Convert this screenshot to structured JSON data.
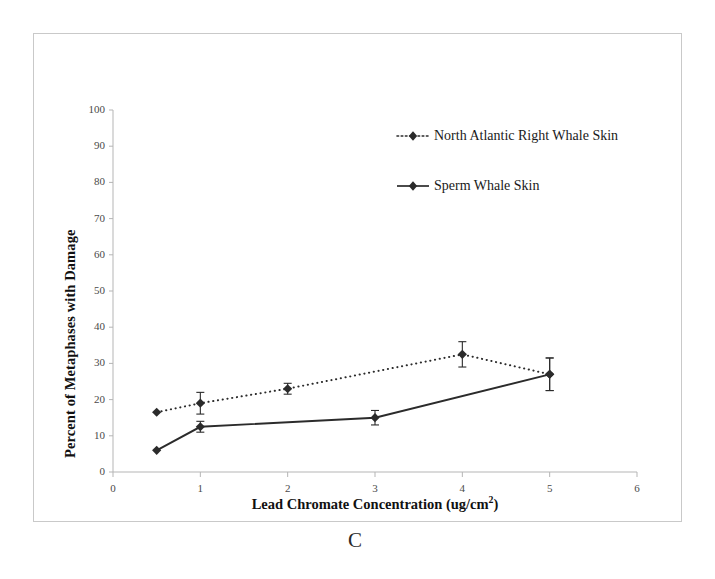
{
  "figure": {
    "panel_letter": "C",
    "frame_color": "#c9c9c9",
    "background": "#ffffff"
  },
  "axes": {
    "x": {
      "label_main": "Lead Chromate Concentration (ug/cm",
      "label_sup": "2",
      "label_tail": ")",
      "label_full": "Lead Chromate Concentration (ug/cm2)",
      "ticks": [
        0,
        1,
        2,
        3,
        4,
        5,
        6
      ],
      "min": 0,
      "max": 6
    },
    "y": {
      "label": "Percent of Metaphases with Damage",
      "ticks": [
        0,
        10,
        20,
        30,
        40,
        50,
        60,
        70,
        80,
        90,
        100
      ],
      "min": 0,
      "max": 100
    }
  },
  "legend": {
    "position": "upper-right-inside",
    "items": [
      {
        "label": "North Atlantic Right Whale Skin",
        "style": "dotted",
        "marker": "diamond",
        "color": "#2b2b2b"
      },
      {
        "label": "Sperm Whale Skin",
        "style": "solid",
        "marker": "diamond",
        "color": "#2b2b2b"
      }
    ]
  },
  "chart_data": {
    "type": "line",
    "title": "",
    "xlabel": "Lead Chromate Concentration (ug/cm2)",
    "ylabel": "Percent of Metaphases with Damage",
    "xlim": [
      0,
      6
    ],
    "ylim": [
      0,
      100
    ],
    "xticks": [
      0,
      1,
      2,
      3,
      4,
      5,
      6
    ],
    "yticks": [
      0,
      10,
      20,
      30,
      40,
      50,
      60,
      70,
      80,
      90,
      100
    ],
    "grid": false,
    "legend_position": "upper right",
    "series": [
      {
        "name": "North Atlantic Right Whale Skin",
        "linestyle": "dotted",
        "marker": "diamond",
        "color": "#2b2b2b",
        "points": [
          {
            "x": 0.5,
            "y": 16.5,
            "err": 0
          },
          {
            "x": 1,
            "y": 19,
            "err": 3
          },
          {
            "x": 2,
            "y": 23,
            "err": 1.5
          },
          {
            "x": 4,
            "y": 32.5,
            "err": 3.5
          },
          {
            "x": 5,
            "y": 27,
            "err": 4.5
          }
        ]
      },
      {
        "name": "Sperm Whale Skin",
        "linestyle": "solid",
        "marker": "diamond",
        "color": "#2b2b2b",
        "points": [
          {
            "x": 0.5,
            "y": 6,
            "err": 0
          },
          {
            "x": 1,
            "y": 12.5,
            "err": 1.5
          },
          {
            "x": 3,
            "y": 15,
            "err": 2
          },
          {
            "x": 5,
            "y": 27,
            "err": 4.5
          }
        ]
      }
    ]
  }
}
